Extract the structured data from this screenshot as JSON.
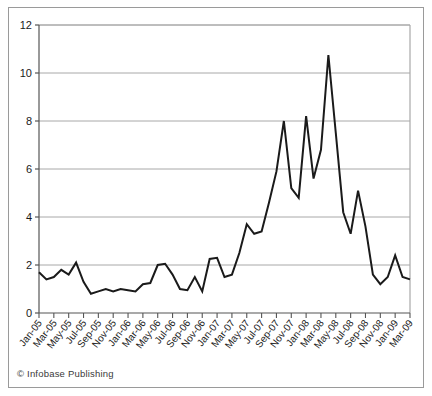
{
  "credit": "© Infobase Publishing",
  "colors": {
    "line": "#1a1a1a",
    "grid": "#a8a8a8",
    "axis": "#555555",
    "frame": "#9a9a9a",
    "background": "#ffffff",
    "text": "#1a1a1a"
  },
  "chart_data": {
    "type": "line",
    "title": "",
    "subtitle": "",
    "xlabel": "",
    "ylabel": "",
    "grid": true,
    "legend": "none",
    "ylim": [
      0,
      12
    ],
    "yticks": [
      0,
      2,
      4,
      6,
      8,
      10,
      12
    ],
    "ytick_labels": [
      "0",
      "2",
      "4",
      "6",
      "8",
      "10",
      "12"
    ],
    "x": [
      "Jan-05",
      "Feb-05",
      "Mar-05",
      "Apr-05",
      "May-05",
      "Jun-05",
      "Jul-05",
      "Aug-05",
      "Sep-05",
      "Oct-05",
      "Nov-05",
      "Dec-05",
      "Jan-06",
      "Feb-06",
      "Mar-06",
      "Apr-06",
      "May-06",
      "Jun-06",
      "Jul-06",
      "Aug-06",
      "Sep-06",
      "Oct-06",
      "Nov-06",
      "Dec-06",
      "Jan-07",
      "Feb-07",
      "Mar-07",
      "Apr-07",
      "May-07",
      "Jun-07",
      "Jul-07",
      "Aug-07",
      "Sep-07",
      "Oct-07",
      "Nov-07",
      "Dec-07",
      "Jan-08",
      "Feb-08",
      "Mar-08",
      "Apr-08",
      "May-08",
      "Jun-08",
      "Jul-08",
      "Aug-08",
      "Sep-08",
      "Oct-08",
      "Nov-08",
      "Dec-08",
      "Jan-09",
      "Feb-09",
      "Mar-09"
    ],
    "xtick_labels": [
      "Jan-05",
      "Mar-05",
      "May-05",
      "Jul-05",
      "Sep-05",
      "Nov-05",
      "Jan-06",
      "Mar-06",
      "May-06",
      "Jul-06",
      "Sep-06",
      "Nov-06",
      "Jan-07",
      "Mar-07",
      "May-07",
      "Jul-07",
      "Sep-07",
      "Nov-07",
      "Jan-08",
      "Mar-08",
      "May-08",
      "Jul-08",
      "Sep-08",
      "Nov-08",
      "Jan-09",
      "Mar-09"
    ],
    "values": [
      1.7,
      1.4,
      1.5,
      1.8,
      1.6,
      2.1,
      1.3,
      0.8,
      0.9,
      1.0,
      0.9,
      1.0,
      0.95,
      0.9,
      1.2,
      1.25,
      2.0,
      2.05,
      1.6,
      1.0,
      0.95,
      1.5,
      0.9,
      2.25,
      2.3,
      1.5,
      1.6,
      2.5,
      3.7,
      3.3,
      3.4,
      4.6,
      5.9,
      8.0,
      5.2,
      4.8,
      8.2,
      5.6,
      6.8,
      10.75,
      7.5,
      4.2,
      3.3,
      5.1,
      3.6,
      1.6,
      1.2,
      1.5,
      2.4,
      1.5,
      1.4
    ]
  }
}
